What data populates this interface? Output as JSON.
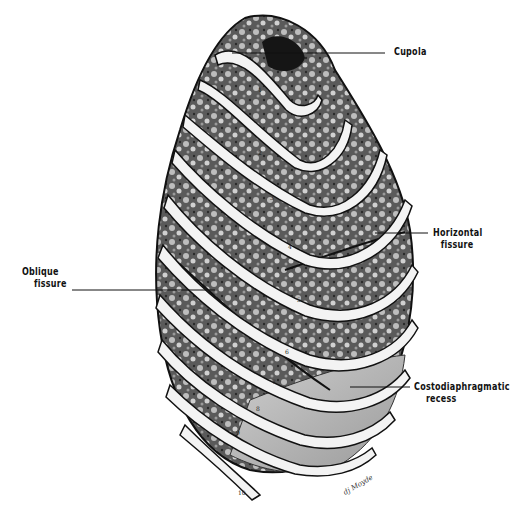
{
  "figure": {
    "labels": {
      "cupola": "Cupola",
      "horizontal_fissure": [
        "Horizontal",
        "fissure"
      ],
      "oblique_fissure": [
        "Oblique",
        "fissure"
      ],
      "costodiaphragmatic_recess": [
        "Costodiaphragmatic",
        "recess"
      ]
    },
    "rib_numbers": [
      "1",
      "2",
      "3",
      "4",
      "5",
      "6",
      "7",
      "8",
      "9",
      "10"
    ],
    "signature": "dj Moyde",
    "colors": {
      "ink": "#111111",
      "lung_dark": "#3a3a3a",
      "lung_mid": "#7a7a7a",
      "rib": "#f2f2f2",
      "recess": "#b8b8b8"
    }
  }
}
